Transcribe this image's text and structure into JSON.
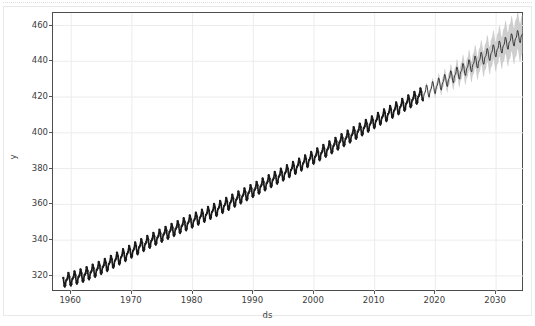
{
  "chart_data": {
    "type": "line",
    "title": "",
    "xlabel": "ds",
    "ylabel": "y",
    "xlim": [
      1957.0,
      2034.6
    ],
    "ylim": [
      311.0,
      467.0
    ],
    "xticks": [
      1960,
      1970,
      1980,
      1990,
      2000,
      2010,
      2020,
      2030
    ],
    "xtick_labels": [
      "1960",
      "1970",
      "1980",
      "1990",
      "2000",
      "2010",
      "2020",
      "2030"
    ],
    "yticks": [
      320,
      340,
      360,
      380,
      400,
      420,
      440,
      460
    ],
    "ytick_labels": [
      "320",
      "340",
      "360",
      "380",
      "400",
      "420",
      "440",
      "460"
    ],
    "grid": true,
    "grid_color": "#ececec",
    "legend": null,
    "history_end_x": 2018.0,
    "forecast_end_x": 2034.4,
    "colors": {
      "history_line": "#1a1a1a",
      "forecast_line": "#2b2b2b",
      "uncertainty_band": "#c6c6c6",
      "axes_border": "#4d4d4d",
      "tick_text": "#3c3c3c",
      "figure_background": "#ffffff",
      "axes_background": "#ffffff"
    },
    "seasonality": {
      "period_years": 1.0,
      "cycles_per_year": 1,
      "amplitude": 4.2,
      "shape": "sawtooth"
    },
    "series": [
      {
        "name": "trend",
        "comment": "smooth trend component sampled at yearly knots (x = year, y = value)",
        "x": [
          1958.7,
          1960,
          1962,
          1964,
          1966,
          1968,
          1970,
          1972,
          1974,
          1976,
          1978,
          1980,
          1982,
          1984,
          1986,
          1988,
          1990,
          1992,
          1994,
          1996,
          1998,
          2000,
          2002,
          2004,
          2006,
          2008,
          2010,
          2012,
          2014,
          2016,
          2018,
          2020,
          2022,
          2024,
          2026,
          2028,
          2030,
          2032,
          2034.4
        ],
        "y": [
          317.4,
          318.2,
          320.3,
          323.1,
          326.4,
          330.1,
          333.9,
          337.6,
          341.1,
          344.4,
          347.6,
          350.7,
          353.9,
          357.2,
          360.6,
          364.2,
          367.8,
          371.5,
          375.2,
          378.9,
          382.6,
          386.4,
          390.3,
          394.3,
          398.3,
          402.3,
          406.3,
          410.2,
          414.1,
          418.0,
          421.9,
          425.8,
          429.8,
          433.9,
          438.0,
          442.2,
          446.4,
          450.6,
          455.0
        ]
      },
      {
        "name": "yhat_upper",
        "comment": "upper uncertainty bound offsets from trend, forecast region only",
        "x": [
          2018.0,
          2020,
          2022,
          2024,
          2026,
          2028,
          2030,
          2032,
          2034.4
        ],
        "offset": [
          0.8,
          2.2,
          3.4,
          4.6,
          5.8,
          7.1,
          8.4,
          9.6,
          11.0
        ]
      },
      {
        "name": "yhat_lower",
        "comment": "lower uncertainty bound offsets from trend, forecast region only",
        "x": [
          2018.0,
          2020,
          2022,
          2024,
          2026,
          2028,
          2030,
          2032,
          2034.4
        ],
        "offset": [
          -0.8,
          -2.2,
          -3.4,
          -4.6,
          -5.8,
          -7.1,
          -8.4,
          -9.6,
          -11.0
        ]
      }
    ]
  }
}
